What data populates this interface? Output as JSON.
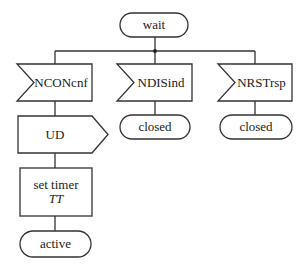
{
  "diagram": {
    "type": "SDL state transition",
    "colors": {
      "stroke": "#333333",
      "background": "#ffffff",
      "text": "#222222"
    },
    "start_state": {
      "shape": "terminator",
      "label": "wait"
    },
    "branches": [
      {
        "input": {
          "shape": "input-signal",
          "label": "NCONcnf"
        },
        "steps": [
          {
            "shape": "output-signal",
            "label": "UD"
          },
          {
            "shape": "task",
            "label": "set timer",
            "sublabel": "TT"
          }
        ],
        "next_state": {
          "shape": "terminator",
          "label": "active"
        }
      },
      {
        "input": {
          "shape": "input-signal",
          "label": "NDISind"
        },
        "steps": [],
        "next_state": {
          "shape": "terminator",
          "label": "closed"
        }
      },
      {
        "input": {
          "shape": "input-signal",
          "label": "NRSTrsp"
        },
        "steps": [],
        "next_state": {
          "shape": "terminator",
          "label": "closed"
        }
      }
    ]
  }
}
